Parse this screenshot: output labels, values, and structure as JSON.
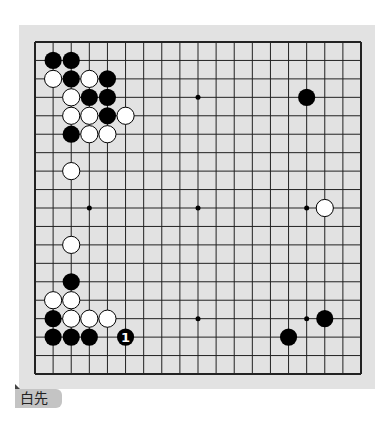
{
  "problem": {
    "label": "白先",
    "board_size": 19
  },
  "colors": {
    "board_background": "#e2e2e2",
    "grid_line": "#222222",
    "black_stone": "#000000",
    "white_stone": "#ffffff",
    "label_background": "#c4c4c4"
  },
  "star_points": [
    [
      3,
      3
    ],
    [
      9,
      3
    ],
    [
      15,
      3
    ],
    [
      3,
      9
    ],
    [
      9,
      9
    ],
    [
      15,
      9
    ],
    [
      3,
      15
    ],
    [
      9,
      15
    ],
    [
      15,
      15
    ]
  ],
  "stones": [
    {
      "color": "black",
      "col": 1,
      "row": 1
    },
    {
      "color": "black",
      "col": 2,
      "row": 1
    },
    {
      "color": "white",
      "col": 1,
      "row": 2
    },
    {
      "color": "black",
      "col": 2,
      "row": 2
    },
    {
      "color": "white",
      "col": 3,
      "row": 2
    },
    {
      "color": "black",
      "col": 4,
      "row": 2
    },
    {
      "color": "white",
      "col": 2,
      "row": 3
    },
    {
      "color": "black",
      "col": 3,
      "row": 3
    },
    {
      "color": "black",
      "col": 4,
      "row": 3
    },
    {
      "color": "white",
      "col": 2,
      "row": 4
    },
    {
      "color": "white",
      "col": 3,
      "row": 4
    },
    {
      "color": "black",
      "col": 4,
      "row": 4
    },
    {
      "color": "white",
      "col": 5,
      "row": 4
    },
    {
      "color": "black",
      "col": 2,
      "row": 5
    },
    {
      "color": "white",
      "col": 3,
      "row": 5
    },
    {
      "color": "white",
      "col": 4,
      "row": 5
    },
    {
      "color": "white",
      "col": 2,
      "row": 7
    },
    {
      "color": "black",
      "col": 15,
      "row": 3
    },
    {
      "color": "white",
      "col": 16,
      "row": 9
    },
    {
      "color": "white",
      "col": 2,
      "row": 11
    },
    {
      "color": "black",
      "col": 2,
      "row": 13
    },
    {
      "color": "white",
      "col": 1,
      "row": 14
    },
    {
      "color": "white",
      "col": 2,
      "row": 14
    },
    {
      "color": "black",
      "col": 1,
      "row": 15
    },
    {
      "color": "white",
      "col": 2,
      "row": 15
    },
    {
      "color": "white",
      "col": 3,
      "row": 15
    },
    {
      "color": "white",
      "col": 4,
      "row": 15
    },
    {
      "color": "black",
      "col": 1,
      "row": 16
    },
    {
      "color": "black",
      "col": 2,
      "row": 16
    },
    {
      "color": "black",
      "col": 3,
      "row": 16
    },
    {
      "color": "black",
      "col": 5,
      "row": 16,
      "label": "1"
    },
    {
      "color": "black",
      "col": 16,
      "row": 15
    },
    {
      "color": "black",
      "col": 14,
      "row": 16
    }
  ]
}
